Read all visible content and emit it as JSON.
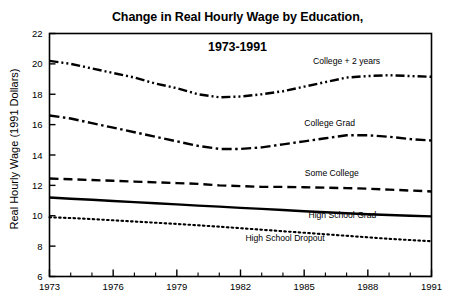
{
  "chart_data": {
    "type": "line",
    "title": "Change in Real Hourly Wage by Education,\n1973-1991",
    "title_line1": "Change in Real Hourly Wage by Education,",
    "title_line2": "1973-1991",
    "xlabel": "",
    "ylabel": "Real Hourly Wage (1991 Dollars)",
    "xlim": [
      1973,
      1991
    ],
    "ylim": [
      6,
      22
    ],
    "ytick_step": 2,
    "yticks": [
      6,
      8,
      10,
      12,
      14,
      16,
      18,
      20,
      22
    ],
    "ytick_labels": [
      "6",
      "8",
      "10",
      "12",
      "14",
      "16",
      "18",
      "20",
      "22"
    ],
    "xticks": [
      1973,
      1976,
      1979,
      1982,
      1985,
      1988,
      1991
    ],
    "xtick_labels": [
      "1973",
      "1976",
      "1979",
      "1982",
      "1985",
      "1988",
      "1991"
    ],
    "x_minor_ticks": [
      1974,
      1975,
      1977,
      1978,
      1980,
      1981,
      1983,
      1984,
      1986,
      1987,
      1989,
      1990
    ],
    "grid": false,
    "legend_position": "inline-labels",
    "x": [
      1973,
      1974,
      1975,
      1976,
      1977,
      1978,
      1979,
      1980,
      1981,
      1982,
      1983,
      1984,
      1985,
      1986,
      1987,
      1988,
      1989,
      1990,
      1991
    ],
    "series": [
      {
        "name": "College + 2 years",
        "label": "College + 2 years",
        "style": "dash-dot-dot",
        "color": "#000000",
        "label_x": 1987.0,
        "label_y": 20.0,
        "values": [
          20.2,
          20.0,
          19.7,
          19.4,
          19.1,
          18.7,
          18.4,
          18.0,
          17.8,
          17.85,
          18.0,
          18.2,
          18.5,
          18.8,
          19.1,
          19.2,
          19.25,
          19.2,
          19.15
        ]
      },
      {
        "name": "College Grad",
        "label": "College Grad",
        "style": "dash-dot",
        "color": "#000000",
        "label_x": 1986.2,
        "label_y": 15.9,
        "values": [
          16.6,
          16.4,
          16.1,
          15.8,
          15.5,
          15.2,
          14.9,
          14.6,
          14.4,
          14.4,
          14.5,
          14.7,
          14.9,
          15.1,
          15.3,
          15.3,
          15.2,
          15.05,
          14.95
        ]
      },
      {
        "name": "Some College",
        "label": "Some College",
        "style": "dashed",
        "color": "#000000",
        "label_x": 1986.3,
        "label_y": 12.6,
        "values": [
          12.45,
          12.4,
          12.35,
          12.3,
          12.25,
          12.2,
          12.15,
          12.1,
          12.0,
          11.95,
          11.9,
          11.9,
          11.88,
          11.85,
          11.82,
          11.78,
          11.72,
          11.66,
          11.6
        ]
      },
      {
        "name": "High School Grad",
        "label": "High School Grad",
        "style": "solid",
        "color": "#000000",
        "label_x": 1986.8,
        "label_y": 9.85,
        "values": [
          11.2,
          11.12,
          11.05,
          10.97,
          10.9,
          10.82,
          10.75,
          10.67,
          10.6,
          10.52,
          10.45,
          10.38,
          10.3,
          10.23,
          10.16,
          10.1,
          10.05,
          10.0,
          9.96
        ]
      },
      {
        "name": "High School Dropout",
        "label": "High School Dropout",
        "style": "dotted",
        "color": "#000000",
        "label_x": 1984.1,
        "label_y": 8.35,
        "values": [
          9.9,
          9.85,
          9.78,
          9.7,
          9.62,
          9.54,
          9.46,
          9.37,
          9.28,
          9.18,
          9.08,
          8.98,
          8.88,
          8.78,
          8.68,
          8.58,
          8.48,
          8.4,
          8.32
        ]
      }
    ]
  }
}
